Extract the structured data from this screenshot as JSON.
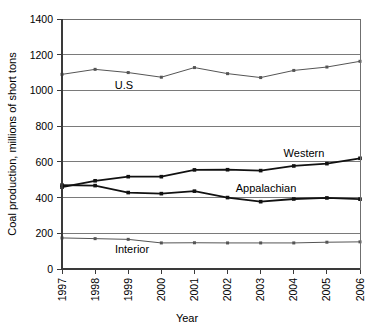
{
  "chart_data": {
    "type": "line",
    "title": "",
    "xlabel": "Year",
    "ylabel": "Coal production, millions of short tons",
    "categories": [
      "1997",
      "1998",
      "1999",
      "2000",
      "2001",
      "2002",
      "2003",
      "2004",
      "2005",
      "2006"
    ],
    "x": [
      1997,
      1998,
      1999,
      2000,
      2001,
      2002,
      2003,
      2004,
      2005,
      2006
    ],
    "ylim": [
      0,
      1400
    ],
    "ytick_values": [
      0,
      200,
      400,
      600,
      800,
      1000,
      1200,
      1400
    ],
    "ytick_labels": [
      "0",
      "200",
      "400",
      "600",
      "800",
      "1000",
      "1200",
      "1400"
    ],
    "grid": "horizontal",
    "legend_position": "inline-annotations",
    "marker": "square",
    "series": [
      {
        "name": "U.S",
        "label": "U.S",
        "color": "#555555",
        "values": [
          1090,
          1118,
          1100,
          1074,
          1128,
          1094,
          1072,
          1112,
          1131,
          1163
        ]
      },
      {
        "name": "Western",
        "label": "Western",
        "color": "#111111",
        "values": [
          458,
          494,
          517,
          517,
          555,
          556,
          551,
          577,
          590,
          620
        ]
      },
      {
        "name": "Appalachian",
        "label": "Appalachian",
        "color": "#111111",
        "values": [
          470,
          467,
          428,
          422,
          436,
          400,
          377,
          392,
          398,
          391
        ]
      },
      {
        "name": "Interior",
        "label": "Interior",
        "color": "#555555",
        "values": [
          174,
          170,
          166,
          146,
          147,
          146,
          146,
          146,
          150,
          152
        ]
      }
    ],
    "annotations": [
      {
        "text": "U.S",
        "series": "U.S"
      },
      {
        "text": "Western",
        "series": "Western"
      },
      {
        "text": "Appalachian",
        "series": "Appalachian"
      },
      {
        "text": "Interior",
        "series": "Interior"
      }
    ]
  },
  "layout": {
    "plot_left": 62,
    "plot_right": 360,
    "plot_top": 19,
    "plot_bottom": 269
  }
}
